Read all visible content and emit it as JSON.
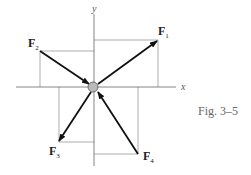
{
  "figure": {
    "caption": "Fig. 3–5",
    "axes": {
      "x_label": "x",
      "y_label": "y"
    },
    "forces": [
      {
        "name": "F",
        "sub": "1",
        "direction": "outward",
        "quadrant": "I"
      },
      {
        "name": "F",
        "sub": "2",
        "direction": "inward",
        "quadrant": "II"
      },
      {
        "name": "F",
        "sub": "3",
        "direction": "outward",
        "quadrant": "III"
      },
      {
        "name": "F",
        "sub": "4",
        "direction": "inward",
        "quadrant": "IV"
      }
    ],
    "particle": "particle"
  }
}
